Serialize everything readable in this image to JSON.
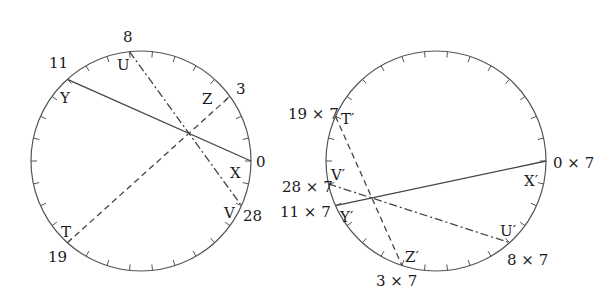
{
  "diagram": {
    "divisions": 30,
    "colors": {
      "stroke": "#555555",
      "text": "#1a1a1a",
      "background": "#ffffff"
    },
    "left_circle": {
      "points": [
        {
          "letter": "X",
          "number": "0",
          "index": 0
        },
        {
          "letter": "Z",
          "number": "3",
          "index": 3
        },
        {
          "letter": "U",
          "number": "8",
          "index": 8
        },
        {
          "letter": "Y",
          "number": "11",
          "index": 11
        },
        {
          "letter": "T",
          "number": "19",
          "index": 19
        },
        {
          "letter": "V",
          "number": "28",
          "index": 28
        }
      ],
      "chords": [
        {
          "from": "Y",
          "to": "X",
          "style": "solid"
        },
        {
          "from": "U",
          "to": "V",
          "style": "dash-dot"
        },
        {
          "from": "T",
          "to": "Z",
          "style": "dashed"
        }
      ]
    },
    "right_circle": {
      "points": [
        {
          "letter": "X′",
          "number": "0 × 7",
          "index": 0
        },
        {
          "letter": "Z′",
          "number": "3 × 7",
          "index": 21
        },
        {
          "letter": "U′",
          "number": "8 × 7",
          "index": 26
        },
        {
          "letter": "Y′",
          "number": "11 × 7",
          "index": 17
        },
        {
          "letter": "T′",
          "number": "19 × 7",
          "index": 13
        },
        {
          "letter": "V′",
          "number": "28 × 7",
          "index": 16
        }
      ],
      "chords": [
        {
          "from": "Y′",
          "to": "X′",
          "style": "solid"
        },
        {
          "from": "V′",
          "to": "U′",
          "style": "dash-dot"
        },
        {
          "from": "T′",
          "to": "Z′",
          "style": "dashed"
        }
      ]
    }
  }
}
